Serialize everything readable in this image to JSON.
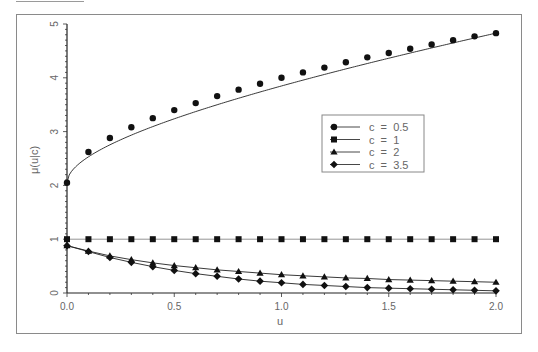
{
  "chart_data": {
    "type": "line",
    "title": "",
    "xlabel": "u",
    "ylabel": "μ(u|c)",
    "xlim": [
      0.0,
      2.0
    ],
    "ylim": [
      0,
      5
    ],
    "x_ticks": [
      "0.0",
      "0.5",
      "1.0",
      "1.5",
      "2.0"
    ],
    "y_ticks": [
      "0",
      "1",
      "2",
      "3",
      "4",
      "5"
    ],
    "grid": false,
    "legend_position": "inside-right",
    "x": [
      0.0,
      0.1,
      0.2,
      0.3,
      0.4,
      0.5,
      0.6,
      0.7,
      0.8,
      0.9,
      1.0,
      1.1,
      1.2,
      1.3,
      1.4,
      1.5,
      1.6,
      1.7,
      1.8,
      1.9,
      2.0
    ],
    "series": [
      {
        "name": "c = 0.5",
        "marker": "circle",
        "values": [
          2.05,
          2.62,
          2.88,
          3.08,
          3.25,
          3.4,
          3.53,
          3.66,
          3.78,
          3.89,
          4.0,
          4.1,
          4.19,
          4.29,
          4.38,
          4.46,
          4.54,
          4.62,
          4.7,
          4.77,
          4.83
        ]
      },
      {
        "name": "c = 1",
        "marker": "square",
        "values": [
          1,
          1,
          1,
          1,
          1,
          1,
          1,
          1,
          1,
          1,
          1,
          1,
          1,
          1,
          1,
          1,
          1,
          1,
          1,
          1,
          1
        ]
      },
      {
        "name": "c = 2",
        "marker": "triangle",
        "values": [
          0.88,
          0.78,
          0.69,
          0.62,
          0.56,
          0.51,
          0.47,
          0.43,
          0.4,
          0.37,
          0.34,
          0.32,
          0.3,
          0.28,
          0.27,
          0.25,
          0.24,
          0.23,
          0.22,
          0.21,
          0.2
        ]
      },
      {
        "name": "c = 3.5",
        "marker": "diamond",
        "values": [
          0.88,
          0.77,
          0.66,
          0.57,
          0.49,
          0.42,
          0.36,
          0.31,
          0.26,
          0.22,
          0.19,
          0.16,
          0.14,
          0.12,
          0.1,
          0.09,
          0.08,
          0.07,
          0.06,
          0.05,
          0.04
        ]
      }
    ]
  },
  "legend": {
    "items": [
      {
        "label": "c  =  0.5"
      },
      {
        "label": "c  =  1"
      },
      {
        "label": "c  =  2"
      },
      {
        "label": "c  =  3.5"
      }
    ]
  },
  "axes": {
    "xlabel": "u",
    "ylabel": "μ(u|c)"
  }
}
